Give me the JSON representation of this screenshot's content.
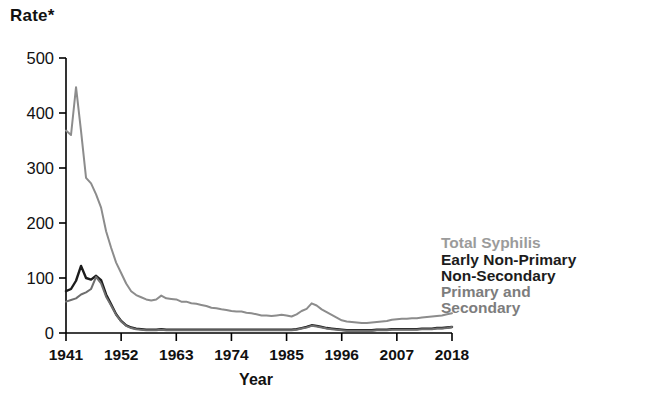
{
  "chart_data": {
    "type": "line",
    "title": "",
    "ylabel": "Rate*",
    "xlabel": "Year",
    "ylim": [
      0,
      500
    ],
    "xlim": [
      1941,
      2018
    ],
    "yticks": [
      0,
      100,
      200,
      300,
      400,
      500
    ],
    "xticks": [
      1941,
      1952,
      1963,
      1974,
      1985,
      1996,
      2007,
      2018
    ],
    "grid": false,
    "legend_position": "right-inside",
    "x": [
      1941,
      1942,
      1943,
      1944,
      1945,
      1946,
      1947,
      1948,
      1949,
      1950,
      1951,
      1952,
      1953,
      1954,
      1955,
      1956,
      1957,
      1958,
      1959,
      1960,
      1961,
      1962,
      1963,
      1964,
      1965,
      1966,
      1967,
      1968,
      1969,
      1970,
      1971,
      1972,
      1973,
      1974,
      1975,
      1976,
      1977,
      1978,
      1979,
      1980,
      1981,
      1982,
      1983,
      1984,
      1985,
      1986,
      1987,
      1988,
      1989,
      1990,
      1991,
      1992,
      1993,
      1994,
      1995,
      1996,
      1997,
      1998,
      1999,
      2000,
      2001,
      2002,
      2003,
      2004,
      2005,
      2006,
      2007,
      2008,
      2009,
      2010,
      2011,
      2012,
      2013,
      2014,
      2015,
      2016,
      2017,
      2018
    ],
    "series": [
      {
        "name": "Total Syphilis",
        "color": "#8c8c8c",
        "values": [
          368,
          360,
          447,
          367,
          282,
          272,
          252,
          228,
          185,
          155,
          128,
          109,
          90,
          76,
          69,
          65,
          61,
          59,
          61,
          68,
          63,
          62,
          61,
          57,
          57,
          54,
          53,
          51,
          49,
          46,
          45,
          43,
          42,
          40,
          39,
          39,
          37,
          36,
          34,
          32,
          32,
          31,
          32,
          33,
          32,
          30,
          34,
          40,
          44,
          54,
          50,
          43,
          38,
          33,
          28,
          23,
          21,
          20,
          19,
          18,
          18,
          19,
          20,
          21,
          22,
          24,
          25,
          26,
          26,
          27,
          27,
          28,
          29,
          30,
          31,
          32,
          34,
          36
        ]
      },
      {
        "name": "Early Non-Primary Non-Secondary",
        "color": "#1c1c1c",
        "values": [
          76,
          80,
          95,
          122,
          100,
          97,
          104,
          96,
          70,
          52,
          34,
          22,
          14,
          10,
          8,
          7,
          6,
          6,
          6,
          7,
          6,
          6,
          6,
          6,
          6,
          6,
          6,
          6,
          6,
          6,
          6,
          6,
          6,
          6,
          6,
          6,
          6,
          6,
          6,
          6,
          6,
          6,
          6,
          6,
          6,
          6,
          7,
          9,
          11,
          14,
          13,
          11,
          9,
          8,
          7,
          6,
          5,
          5,
          5,
          5,
          5,
          5,
          6,
          6,
          6,
          7,
          7,
          7,
          7,
          7,
          7,
          8,
          8,
          8,
          9,
          9,
          10,
          11
        ]
      },
      {
        "name": "Primary and Secondary",
        "color": "#6e6e6e",
        "values": [
          57,
          60,
          63,
          70,
          74,
          80,
          102,
          90,
          66,
          50,
          33,
          21,
          13,
          9,
          7,
          6,
          5,
          5,
          5,
          6,
          5,
          5,
          5,
          5,
          5,
          5,
          5,
          5,
          5,
          5,
          5,
          5,
          5,
          5,
          5,
          5,
          5,
          5,
          5,
          5,
          5,
          5,
          5,
          5,
          5,
          5,
          6,
          8,
          10,
          13,
          12,
          10,
          8,
          7,
          6,
          5,
          4,
          4,
          4,
          4,
          4,
          4,
          5,
          5,
          5,
          6,
          6,
          6,
          6,
          6,
          6,
          7,
          7,
          7,
          8,
          8,
          9,
          11
        ]
      }
    ]
  },
  "axis": {
    "y_title": "Rate*",
    "x_title": "Year",
    "ytick_labels": [
      "500",
      "400",
      "300",
      "200",
      "100",
      "0"
    ],
    "xtick_labels": [
      "1941",
      "1952",
      "1963",
      "1974",
      "1985",
      "1996",
      "2007",
      "2018"
    ]
  },
  "legend": {
    "total": "Total Syphilis",
    "early_line1": "Early Non-Primary",
    "early_line2": "Non-Secondary",
    "ps_line1": "Primary and",
    "ps_line2": "Secondary"
  },
  "colors": {
    "total_syphilis": "#8c8c8c",
    "early_non_primary": "#1c1c1c",
    "primary_secondary": "#6e6e6e",
    "axis": "#000000",
    "background": "#ffffff"
  }
}
